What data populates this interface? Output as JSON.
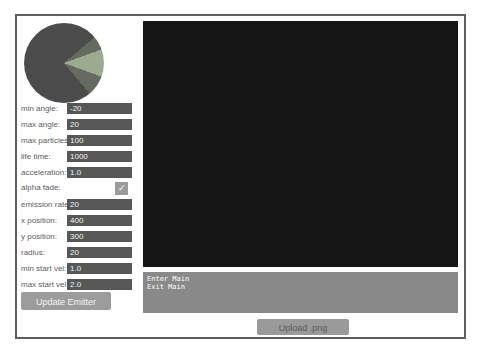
{
  "pie": {
    "base_color": "#4b4b4b",
    "band_color": "#666b62",
    "wedge_color": "#9cab90",
    "wedge_start_deg": -20,
    "wedge_end_deg": 20,
    "band_start_deg": -40,
    "band_end_deg": 50
  },
  "form": {
    "fields_top": [
      {
        "label": "min angle:",
        "value": "-20"
      },
      {
        "label": "max angle:",
        "value": "20"
      },
      {
        "label": "max particles:",
        "value": "100"
      },
      {
        "label": "life time:",
        "value": "1000"
      },
      {
        "label": "acceleration:",
        "value": "1.0"
      }
    ],
    "checkbox": {
      "label": "alpha fade:",
      "checked": true,
      "check_glyph": "✓"
    },
    "fields_bottom": [
      {
        "label": "emission rate:",
        "value": "20"
      },
      {
        "label": "x position:",
        "value": "400"
      },
      {
        "label": "y position:",
        "value": "300"
      },
      {
        "label": "radius:",
        "value": "20"
      },
      {
        "label": "min start vel:",
        "value": "1.0"
      },
      {
        "label": "max start vel:",
        "value": "2.0"
      }
    ],
    "update_button_label": "Update Emitter"
  },
  "canvas": {
    "background": "#151515"
  },
  "console": {
    "background": "#898989",
    "lines": [
      "Enter Main",
      "Exit Main"
    ]
  },
  "upload_button_label": "Upload .png"
}
